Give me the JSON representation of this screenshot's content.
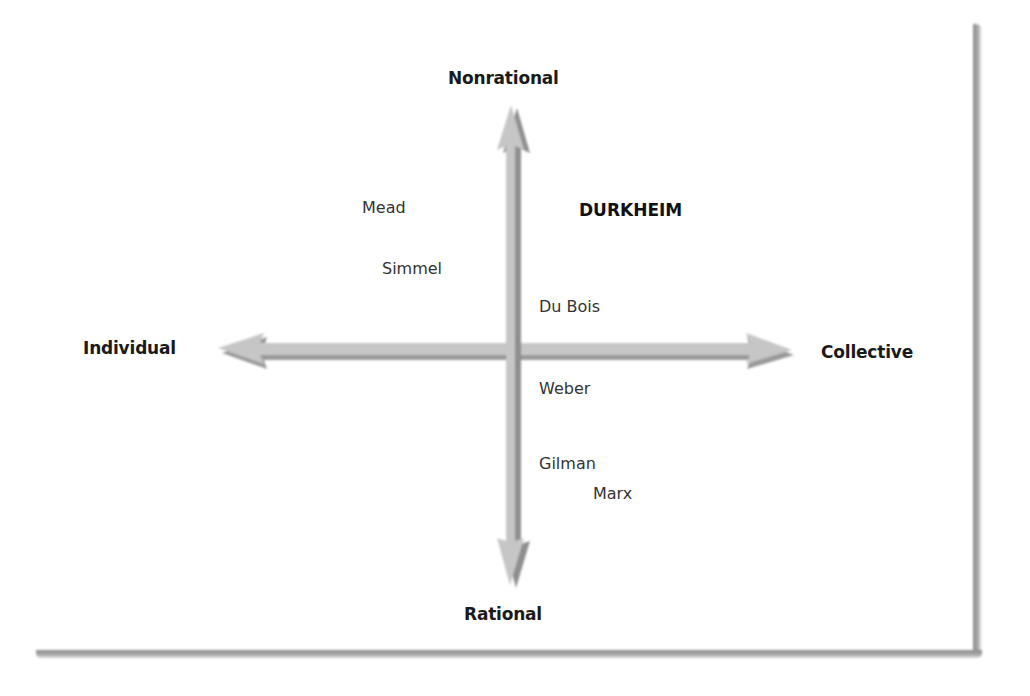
{
  "axes": {
    "top": "Nonrational",
    "bottom": "Rational",
    "left": "Individual",
    "right": "Collective"
  },
  "theorists": [
    {
      "name": "Mead",
      "quadrant": "individual-nonrational",
      "emphasized": false
    },
    {
      "name": "DURKHEIM",
      "quadrant": "collective-nonrational",
      "emphasized": true
    },
    {
      "name": "Simmel",
      "quadrant": "individual-nonrational",
      "emphasized": false
    },
    {
      "name": "Du Bois",
      "quadrant": "collective-nonrational",
      "emphasized": false
    },
    {
      "name": "Weber",
      "quadrant": "collective-rational",
      "emphasized": false
    },
    {
      "name": "Gilman",
      "quadrant": "collective-rational",
      "emphasized": false
    },
    {
      "name": "Marx",
      "quadrant": "collective-rational",
      "emphasized": false
    }
  ],
  "colors": {
    "arrow_fill": "#c4c4c4",
    "arrow_shadow": "#8f8f8f",
    "text": "#1a1a1a",
    "frame_shadow": "#8a8a8a"
  }
}
